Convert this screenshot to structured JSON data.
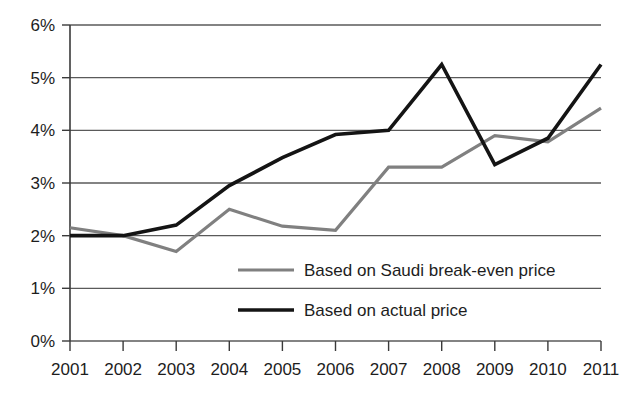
{
  "chart_data": {
    "type": "line",
    "title": "",
    "subtitle": "",
    "xlabel": "",
    "ylabel": "",
    "x": [
      "2001",
      "2002",
      "2003",
      "2004",
      "2005",
      "2006",
      "2007",
      "2008",
      "2009",
      "2010",
      "2011"
    ],
    "categories": [
      "2001",
      "2002",
      "2003",
      "2004",
      "2005",
      "2006",
      "2007",
      "2008",
      "2009",
      "2010",
      "2011"
    ],
    "ylim": [
      0,
      6
    ],
    "y_ticks": [
      0,
      1,
      2,
      3,
      4,
      5,
      6
    ],
    "y_tick_labels": [
      "0%",
      "1%",
      "2%",
      "3%",
      "4%",
      "5%",
      "6%"
    ],
    "x_tick_labels": [
      "2001",
      "2002",
      "2003",
      "2004",
      "2005",
      "2006",
      "2007",
      "2008",
      "2009",
      "2010",
      "2011"
    ],
    "grid": "horizontal",
    "legend_position": "inside-center",
    "series": [
      {
        "name": "Based on Saudi break-even price",
        "color": "#808080",
        "values": [
          2.15,
          2.0,
          1.7,
          2.5,
          2.18,
          2.1,
          3.3,
          3.3,
          3.9,
          3.78,
          4.42
        ]
      },
      {
        "name": "Based on actual price",
        "color": "#141414",
        "values": [
          2.0,
          2.0,
          2.2,
          2.95,
          3.48,
          3.92,
          4.0,
          5.25,
          3.35,
          3.85,
          5.25
        ]
      }
    ],
    "legend": [
      {
        "label": "Based on Saudi break-even price",
        "color": "#808080"
      },
      {
        "label": "Based on actual price",
        "color": "#141414"
      }
    ],
    "annotations": []
  },
  "axis": {
    "y_labels": [
      "6%",
      "5%",
      "4%",
      "3%",
      "2%",
      "1%",
      "0%"
    ],
    "x_labels": [
      "2001",
      "2002",
      "2003",
      "2004",
      "2005",
      "2006",
      "2007",
      "2008",
      "2009",
      "2010",
      "2011"
    ]
  },
  "legend": {
    "entries": [
      {
        "label": "Based on Saudi break-even price"
      },
      {
        "label": "Based on actual price"
      }
    ]
  },
  "colors": {
    "series_gray": "#808080",
    "series_black": "#141414",
    "gridline": "#5a5a5a",
    "axis": "#3a3a3a",
    "background": "#ffffff",
    "text": "#1d1d1d"
  }
}
